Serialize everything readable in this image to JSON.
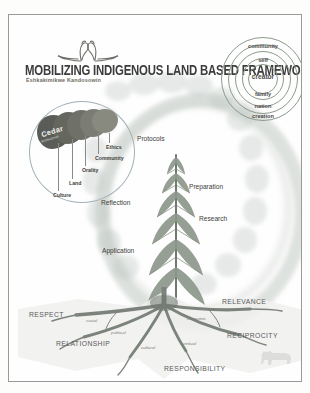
{
  "poster": {
    "title": "MOBILIZING INDIGENOUS LAND BASED FRAMEWORK",
    "subtitle": "Eshkakimikwe Kandosowin",
    "logo_icon": "two-swans-icon",
    "background_color": "#fdfdfc",
    "frame_color": "#9a9a9a"
  },
  "relationship_circles": {
    "name": "concentric-relationship-circles",
    "rings": [
      {
        "label": "community",
        "level": 1
      },
      {
        "label": "self",
        "level": 2
      },
      {
        "label": "creator",
        "level": 3
      },
      {
        "label": "family",
        "level": 4
      },
      {
        "label": "nation",
        "level": 5
      },
      {
        "label": "creation",
        "level": 6
      }
    ],
    "stroke_color": "#8d9a8d"
  },
  "cedar_inset": {
    "name": "cedar-layers-diagram",
    "heading": "Cedar",
    "heading_sub": "Kishkadown",
    "layers": [
      {
        "label": "Ethics"
      },
      {
        "label": "Community"
      },
      {
        "label": "Orality"
      },
      {
        "label": "Land"
      },
      {
        "label": "Culture"
      }
    ],
    "blob_color": "#6d6f6b"
  },
  "tree": {
    "name": "cedar-tree-process",
    "stages": [
      {
        "label": "Protocols"
      },
      {
        "label": "Preparation"
      },
      {
        "label": "Research"
      },
      {
        "label": "Reflection"
      },
      {
        "label": "Application"
      }
    ],
    "foliage_color": "#8e998d",
    "trunk_color": "#6f7a6d"
  },
  "roots": {
    "name": "four-r-roots",
    "principles": [
      {
        "label": "RESPECT"
      },
      {
        "label": "RELEVANCE"
      },
      {
        "label": "RECIPROCITY"
      },
      {
        "label": "RELATIONSHIP"
      },
      {
        "label": "RESPONSIBILITY"
      }
    ],
    "dimensions": [
      {
        "label": "social"
      },
      {
        "label": "political"
      },
      {
        "label": "economic"
      },
      {
        "label": "cultural"
      },
      {
        "label": "spiritual"
      }
    ],
    "root_color": "#7c837c"
  },
  "decor": {
    "bison_icon": "bison-silhouette-icon",
    "ring_icon": "cloud-ring"
  }
}
